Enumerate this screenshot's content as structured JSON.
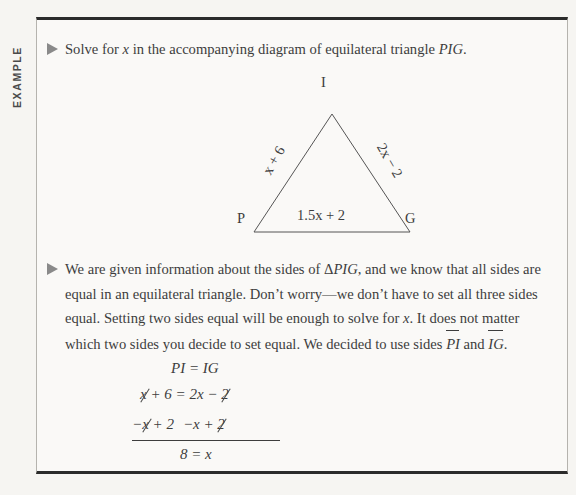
{
  "sidebar": {
    "label": "EXAMPLE"
  },
  "box": {
    "border_color": "#2b2b2b",
    "background": "#faf9f7"
  },
  "paragraphs": [
    {
      "id": "problem-statement",
      "bullet_icon": "triangle-right-icon",
      "parts": [
        {
          "text": "Solve for ",
          "style": "normal"
        },
        {
          "text": "x",
          "style": "italic"
        },
        {
          "text": " in the accompanying diagram of equilateral triangle ",
          "style": "normal"
        },
        {
          "text": "PIG",
          "style": "italic"
        },
        {
          "text": ".",
          "style": "normal"
        }
      ],
      "plain": "Solve for x in the accompanying diagram of equilateral triangle PIG."
    },
    {
      "id": "solution-explanation",
      "bullet_icon": "triangle-right-icon",
      "parts": [
        {
          "text": "We are given information about the sides of Δ",
          "style": "normal"
        },
        {
          "text": "PIG",
          "style": "italic"
        },
        {
          "text": ", and we know that all sides are equal in an equilateral triangle. Don’t worry—we don’t have to set all three sides equal. Setting two sides equal will be enough to solve for ",
          "style": "normal"
        },
        {
          "text": "x",
          "style": "italic"
        },
        {
          "text": ". It does not matter which two sides you decide to set equal. We decided to use sides ",
          "style": "normal"
        },
        {
          "text": "PI",
          "style": "segment"
        },
        {
          "text": " and ",
          "style": "normal"
        },
        {
          "text": "IG",
          "style": "segment"
        },
        {
          "text": ".",
          "style": "normal"
        }
      ],
      "plain": "We are given information about the sides of ΔPIG, and we know that all sides are equal in an equilateral triangle. Don’t worry—we don’t have to set all three sides equal. Setting two sides equal will be enough to solve for x. It does not matter which two sides you decide to set equal. We decided to use sides PI and IG."
    }
  ],
  "figure": {
    "type": "equilateral-triangle-diagram",
    "vertices": [
      {
        "name": "I",
        "position": "top"
      },
      {
        "name": "P",
        "position": "bottom-left"
      },
      {
        "name": "G",
        "position": "bottom-right"
      }
    ],
    "side_labels": {
      "left": "x + 6",
      "right": "2x − 2",
      "base": "1.5x + 2"
    },
    "stroke_color": "#555555"
  },
  "equations": {
    "line_1": "PI = IG",
    "line_2": {
      "full": "x + 6 = 2x − 2",
      "cancelled_left": "x",
      "after_left": " + 6 = 2x − ",
      "cancelled_right": "2"
    },
    "line_3": {
      "full": "−x + 2  −x + 2",
      "minus_left": "−",
      "cancelled_left": "x",
      "mid_left": " + 2",
      "mid_right": "−x + ",
      "cancelled_right": "2"
    },
    "line_4": "8 = x"
  }
}
